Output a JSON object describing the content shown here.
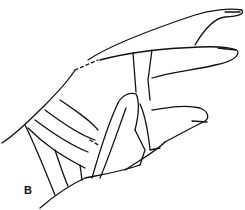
{
  "figure": {
    "label": "B"
  }
}
